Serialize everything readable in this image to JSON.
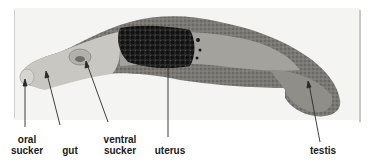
{
  "figure": {
    "colors": {
      "background": "#ffffff",
      "photo_bg": "#f4f4f2",
      "body_light": "#c9c7c2",
      "body_dark": "#6e6d68",
      "uterus_eggs": "#1c1c1c",
      "label_text": "#1a1a1a",
      "pointer_line": "#2a2a2a"
    },
    "labels": [
      {
        "id": "oral_sucker",
        "line1": "oral",
        "line2": "sucker"
      },
      {
        "id": "gut",
        "line1": "",
        "line2": "gut"
      },
      {
        "id": "ventral_sucker",
        "line1": "ventral",
        "line2": "sucker"
      },
      {
        "id": "uterus",
        "line1": "",
        "line2": "uterus"
      },
      {
        "id": "testis",
        "line1": "",
        "line2": "testis"
      }
    ]
  }
}
